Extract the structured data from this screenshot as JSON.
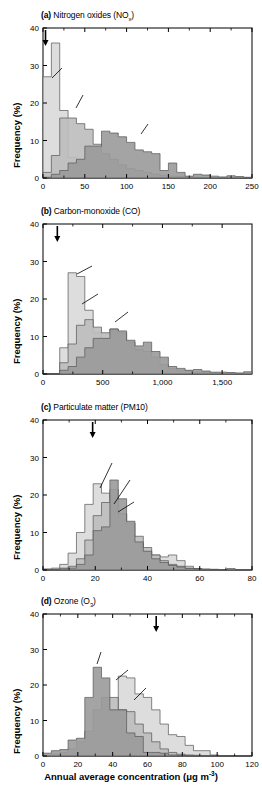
{
  "figure": {
    "xaxis_caption_prefix": "Annual average concentration (",
    "xaxis_caption_unit_a": "μg m",
    "xaxis_caption_unit_sup": "-3",
    "xaxis_caption_suffix": ")",
    "ylabel": "Frequency (%)",
    "colors": {
      "rural": "#d9d9d9",
      "urban": "#bcbcbc",
      "roadside": "#9a9a9a",
      "axis": "#000000",
      "background": "#ffffff"
    }
  },
  "chart_data": [
    {
      "type": "bar",
      "panel": "a",
      "label": "(a)",
      "title_main": "Nitrogen oxides (NO",
      "title_sub": "x",
      "title_end": ")",
      "title_plain": "(a) Nitrogen oxides (NOx)",
      "stations": "3,153 stations",
      "xlabel": "",
      "ylabel": "Frequency (%)",
      "xlim": [
        0,
        250
      ],
      "ylim": [
        0,
        40
      ],
      "xticks": [
        0,
        50,
        100,
        150,
        200,
        250
      ],
      "xticklabels": [
        "0",
        "50",
        "100",
        "150",
        "200",
        "250"
      ],
      "yticks": [
        0,
        10,
        20,
        30,
        40
      ],
      "yticklabels": [
        "0",
        "10",
        "20",
        "30",
        "40"
      ],
      "grid": false,
      "bin_width": 10,
      "annotations": [
        {
          "name": "remote",
          "text": "Remote",
          "value": "(~3)",
          "arrow_x": 3
        },
        {
          "name": "rural",
          "text": "Rural",
          "value": "(16.9)"
        },
        {
          "name": "urban",
          "text": "Urban",
          "value": "(46.0)"
        },
        {
          "name": "roadside",
          "text": "Roadside",
          "value": "(93.2)"
        }
      ],
      "series": [
        {
          "name": "Rural",
          "mean": 16.9,
          "color": "#d9d9d9",
          "values": [
            27.0,
            36.0,
            18.0,
            5.5,
            4.0,
            2.5,
            2.0,
            1.5,
            1.0,
            0.8,
            0.5,
            0.4,
            0.3,
            0.2,
            0.2,
            0.1,
            0.1,
            0.1,
            0.0,
            0.0,
            0.0,
            0.0,
            0.0,
            0.0,
            0.0
          ]
        },
        {
          "name": "Urban",
          "mean": 46.0,
          "color": "#bcbcbc",
          "values": [
            1.5,
            6.0,
            16.0,
            16.0,
            14.5,
            13.0,
            9.0,
            6.5,
            5.0,
            3.5,
            2.5,
            2.0,
            1.5,
            1.0,
            0.7,
            0.5,
            0.4,
            0.3,
            0.2,
            0.1,
            0.1,
            0.1,
            0.0,
            0.0,
            0.0
          ]
        },
        {
          "name": "Roadside",
          "mean": 93.2,
          "color": "#9a9a9a",
          "values": [
            0.2,
            1.0,
            2.0,
            4.0,
            5.0,
            8.5,
            8.5,
            12.5,
            12.0,
            11.0,
            9.5,
            7.5,
            7.0,
            6.5,
            2.0,
            4.0,
            1.5,
            0.5,
            1.0,
            0.8,
            0.5,
            0.3,
            0.6,
            0.4,
            0.2
          ]
        }
      ]
    },
    {
      "type": "bar",
      "panel": "b",
      "label": "(b)",
      "title_main": "Carbon-monoxide (CO)",
      "title_sub": "",
      "title_end": "",
      "title_plain": "(b) Carbon-monoxide (CO)",
      "stations": "1,854 stations",
      "xlabel": "",
      "ylabel": "Frequency (%)",
      "xlim": [
        0,
        1750
      ],
      "ylim": [
        0,
        40
      ],
      "xticks": [
        0,
        500,
        1000,
        1500
      ],
      "xticklabels": [
        "0",
        "500",
        "1,000",
        "1,500"
      ],
      "yticks": [
        0,
        10,
        20,
        30,
        40
      ],
      "yticklabels": [
        "0",
        "10",
        "20",
        "30",
        "40"
      ],
      "grid": false,
      "bin_width": 70,
      "annotations": [
        {
          "name": "remote",
          "text": "Remote",
          "value": "(~120)",
          "arrow_x": 120
        },
        {
          "name": "rural",
          "text": "Rural",
          "value": "(280)"
        },
        {
          "name": "urban",
          "text": "Urban",
          "value": "(450)"
        },
        {
          "name": "roadside",
          "text": "Roadside",
          "value": "(640)"
        }
      ],
      "series": [
        {
          "name": "Rural",
          "mean": 280,
          "color": "#d9d9d9",
          "values": [
            0.0,
            0.0,
            7.0,
            27.0,
            26.0,
            17.0,
            11.0,
            9.5,
            9.0,
            5.0,
            3.0,
            2.0,
            1.0,
            0.7,
            0.5,
            0.3,
            0.2,
            0.1,
            0.1,
            0.1,
            0.0,
            0.0,
            0.0,
            0.0,
            0.0
          ]
        },
        {
          "name": "Urban",
          "mean": 450,
          "color": "#bcbcbc",
          "values": [
            0.0,
            0.0,
            3.0,
            8.0,
            13.0,
            14.5,
            12.5,
            11.0,
            12.0,
            11.0,
            8.5,
            6.5,
            6.0,
            4.5,
            2.5,
            1.5,
            1.0,
            0.8,
            0.5,
            0.4,
            0.3,
            0.2,
            0.2,
            0.1,
            0.1
          ]
        },
        {
          "name": "Roadside",
          "mean": 640,
          "color": "#9a9a9a",
          "values": [
            0.0,
            0.0,
            1.0,
            2.0,
            4.5,
            7.0,
            9.5,
            9.5,
            12.0,
            11.5,
            9.0,
            7.5,
            8.5,
            6.0,
            4.5,
            2.0,
            1.5,
            1.0,
            1.2,
            0.8,
            0.5,
            0.5,
            0.4,
            0.3,
            0.6
          ]
        }
      ]
    },
    {
      "type": "bar",
      "panel": "c",
      "label": "(c)",
      "title_main": "Particulate matter (PM10)",
      "title_sub": "",
      "title_end": "",
      "title_plain": "(c) Particulate matter (PM10)",
      "stations": "3,285 stations",
      "xlabel": "",
      "ylabel": "Frequency (%)",
      "xlim": [
        0,
        80
      ],
      "ylim": [
        0,
        40
      ],
      "xticks": [
        0,
        20,
        40,
        60,
        80
      ],
      "xticklabels": [
        "0",
        "20",
        "40",
        "60",
        "80"
      ],
      "yticks": [
        0,
        10,
        20,
        30,
        40
      ],
      "yticklabels": [
        "0",
        "10",
        "20",
        "30",
        "40"
      ],
      "grid": false,
      "bin_width": 3.2,
      "annotations": [
        {
          "name": "remote",
          "text": "Remote",
          "value": "(~20)",
          "arrow_x": 19
        },
        {
          "name": "rural",
          "text": "Rural",
          "value": "(21.0)"
        },
        {
          "name": "urban",
          "text": "Urban",
          "value": "(27.6)"
        },
        {
          "name": "roadside",
          "text": "Roadside",
          "value": "(29.6)"
        }
      ],
      "series": [
        {
          "name": "Rural",
          "mean": 21.0,
          "color": "#d9d9d9",
          "values": [
            0.3,
            0.5,
            1.5,
            4.5,
            10.0,
            17.5,
            23.0,
            20.5,
            19.0,
            15.0,
            9.0,
            7.0,
            5.0,
            4.0,
            3.5,
            4.0,
            2.5,
            1.0,
            0.4,
            0.2,
            0.2,
            0.1,
            0.3,
            0.1,
            0.1
          ]
        },
        {
          "name": "Urban",
          "mean": 27.6,
          "color": "#bcbcbc",
          "values": [
            0.1,
            0.2,
            0.5,
            1.0,
            3.0,
            8.0,
            14.5,
            18.0,
            21.5,
            15.0,
            12.5,
            9.0,
            6.0,
            4.0,
            2.5,
            1.5,
            1.0,
            0.5,
            0.3,
            0.2,
            0.1,
            0.1,
            0.2,
            0.1,
            0.1
          ]
        },
        {
          "name": "Roadside",
          "mean": 29.6,
          "color": "#9a9a9a",
          "values": [
            0.1,
            0.1,
            0.3,
            0.5,
            1.5,
            4.0,
            10.5,
            11.5,
            24.0,
            19.0,
            13.0,
            7.5,
            5.0,
            3.0,
            2.0,
            1.2,
            0.8,
            0.4,
            0.3,
            0.2,
            0.1,
            0.1,
            0.3,
            0.1,
            0.1
          ]
        }
      ]
    },
    {
      "type": "bar",
      "panel": "d",
      "label": "(d)",
      "title_main": "Ozone (O",
      "title_sub": "3",
      "title_end": ")",
      "title_plain": "(d) Ozone (O3)",
      "stations": "2,490 stations",
      "xlabel": "Annual average concentration (μg m-3)",
      "ylabel": "Frequency (%)",
      "xlim": [
        0,
        120
      ],
      "ylim": [
        0,
        40
      ],
      "xticks": [
        0,
        20,
        40,
        60,
        80,
        100,
        120
      ],
      "xticklabels": [
        "0",
        "20",
        "40",
        "60",
        "80",
        "100",
        "120"
      ],
      "yticks": [
        0,
        10,
        20,
        30,
        40
      ],
      "yticklabels": [
        "0",
        "10",
        "20",
        "30",
        "40"
      ],
      "grid": false,
      "bin_width": 4.8,
      "annotations": [
        {
          "name": "remote",
          "text": "Remote",
          "value": "(~65)",
          "arrow_x": 65
        },
        {
          "name": "roadside",
          "text": "Roadside",
          "value": "(36.0)"
        },
        {
          "name": "urban",
          "text": "Urban",
          "value": "(46.4)"
        },
        {
          "name": "rural",
          "text": "Rural",
          "value": "(56.3)"
        }
      ],
      "series": [
        {
          "name": "Rural",
          "mean": 56.3,
          "color": "#d9d9d9",
          "values": [
            0.1,
            0.2,
            0.3,
            0.6,
            1.0,
            2.0,
            4.5,
            6.5,
            13.0,
            22.5,
            22.0,
            17.5,
            16.5,
            13.0,
            9.0,
            6.0,
            5.5,
            3.0,
            1.5,
            1.5,
            0.3,
            0.1,
            0.0,
            0.0,
            0.0
          ]
        },
        {
          "name": "Urban",
          "mean": 46.4,
          "color": "#bcbcbc",
          "values": [
            0.2,
            0.5,
            1.0,
            2.0,
            4.0,
            7.0,
            13.0,
            16.5,
            16.5,
            13.0,
            12.5,
            9.0,
            6.5,
            4.0,
            2.0,
            1.0,
            0.5,
            0.3,
            0.2,
            0.1,
            0.1,
            0.0,
            0.0,
            0.0,
            0.0
          ]
        },
        {
          "name": "Roadside",
          "mean": 36.0,
          "color": "#9a9a9a",
          "values": [
            0.8,
            1.5,
            1.8,
            4.5,
            5.0,
            16.5,
            25.0,
            22.0,
            13.0,
            13.0,
            6.5,
            5.5,
            1.0,
            1.0,
            0.8,
            0.3,
            0.2,
            0.1,
            0.0,
            0.0,
            0.0,
            0.0,
            0.0,
            0.0,
            0.0
          ]
        }
      ]
    }
  ]
}
